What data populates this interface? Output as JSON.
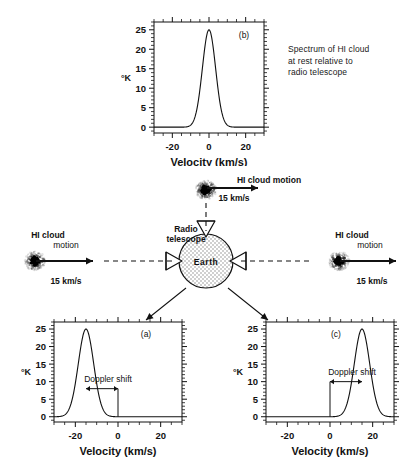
{
  "figure": {
    "caption_note": "Spectrum of HI cloud\nat rest relative to\nradio telescope",
    "ink_color": "#111111"
  },
  "chart_data": [
    {
      "id": "a",
      "type": "line",
      "panel_label": "(a)",
      "title": "",
      "xlabel": "Velocity  (km/s)",
      "ylabel": "°K",
      "xlim": [
        -30,
        30
      ],
      "ylim": [
        -1.5,
        27
      ],
      "xticks": [
        -20,
        0,
        20
      ],
      "xticklabels": [
        "-20",
        "0",
        "20"
      ],
      "xminor_step": 5,
      "yticks": [
        0,
        5,
        10,
        15,
        20,
        25
      ],
      "yticklabels": [
        "0",
        "5",
        "10",
        "15",
        "20",
        "25"
      ],
      "yminor_step": 1,
      "grid": false,
      "peak_center": -15,
      "peak_height": 25,
      "peak_sigma": 3.6,
      "baseline": 0,
      "annotation": {
        "label": "Doppler shift",
        "from_x": -15,
        "to_x": 0,
        "at_y": 8,
        "arrow": "double"
      }
    },
    {
      "id": "b",
      "type": "line",
      "panel_label": "(b)",
      "title": "",
      "xlabel": "Velocity  (km/s)",
      "ylabel": "°K",
      "xlim": [
        -30,
        30
      ],
      "ylim": [
        -1.5,
        27
      ],
      "xticks": [
        -20,
        0,
        20
      ],
      "xticklabels": [
        "-20",
        "0",
        "20"
      ],
      "xminor_step": 5,
      "yticks": [
        0,
        5,
        10,
        15,
        20,
        25
      ],
      "yticklabels": [
        "0",
        "5",
        "10",
        "15",
        "20",
        "25"
      ],
      "yminor_step": 1,
      "grid": false,
      "peak_center": 0,
      "peak_height": 25,
      "peak_sigma": 3.6,
      "baseline": 0,
      "annotation": null
    },
    {
      "id": "c",
      "type": "line",
      "panel_label": "(c)",
      "title": "",
      "xlabel": "Velocity  (km/s)",
      "ylabel": "°K",
      "xlim": [
        -30,
        30
      ],
      "ylim": [
        -1.5,
        27
      ],
      "xticks": [
        -20,
        0,
        20
      ],
      "xticklabels": [
        "-20",
        "0",
        "20"
      ],
      "xminor_step": 5,
      "yticks": [
        0,
        5,
        10,
        15,
        20,
        25
      ],
      "yticklabels": [
        "0",
        "5",
        "10",
        "15",
        "20",
        "25"
      ],
      "yminor_step": 1,
      "grid": false,
      "peak_center": 15,
      "peak_height": 25,
      "peak_sigma": 3.6,
      "baseline": 0,
      "annotation": {
        "label": "Doppler shift",
        "from_x": 0,
        "to_x": 15,
        "at_y": 10,
        "arrow": "double"
      }
    }
  ],
  "diagram": {
    "earth_label": "Earth",
    "telescope_label_line1": "Radio",
    "telescope_label_line2": "telescope",
    "clouds": [
      {
        "id": "left",
        "label_line1": "HI cloud",
        "label_line2": "motion",
        "speed": "15 km/s",
        "direction": "right"
      },
      {
        "id": "top",
        "label_line1": "HI cloud motion",
        "label_line2": "",
        "speed": "15 km/s",
        "direction": "right"
      },
      {
        "id": "right",
        "label_line1": "HI cloud",
        "label_line2": "motion",
        "speed": "15 km/s",
        "direction": "right"
      }
    ]
  }
}
